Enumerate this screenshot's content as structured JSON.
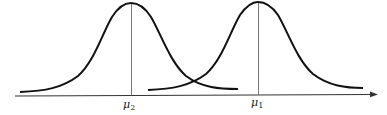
{
  "figure": {
    "type": "two-normal-distributions",
    "colors": {
      "curve": "#111111",
      "axis": "#333333",
      "mean_line": "#555555",
      "background": "#ffffff"
    },
    "axis": {
      "direction": "right-arrow"
    },
    "distributions": [
      {
        "id": "dist-2",
        "mean_label": "μ",
        "mean_subscript": "2",
        "position": "left"
      },
      {
        "id": "dist-1",
        "mean_label": "μ",
        "mean_subscript": "1",
        "position": "right"
      }
    ]
  }
}
